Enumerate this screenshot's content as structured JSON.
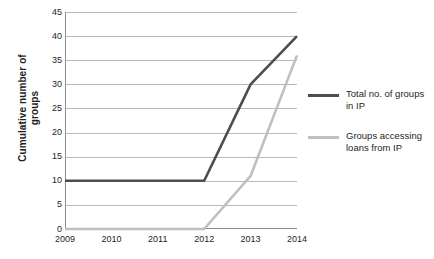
{
  "chart_data": {
    "type": "line",
    "title": "",
    "xlabel": "",
    "ylabel": "Cumulative number of groups",
    "ylabel_line1": "Cumulative number of",
    "ylabel_line2": "groups",
    "x": [
      "2009",
      "2010",
      "2011",
      "2012",
      "2013",
      "2014"
    ],
    "categories": [
      "2009",
      "2010",
      "2011",
      "2012",
      "2013",
      "2014"
    ],
    "xlim": [
      2009,
      2014
    ],
    "ylim": [
      0,
      45
    ],
    "ytick_step": 5,
    "yticks": [
      "45",
      "40",
      "35",
      "30",
      "25",
      "20",
      "15",
      "10",
      "5",
      "0"
    ],
    "ytick_values": [
      45,
      40,
      35,
      30,
      25,
      20,
      15,
      10,
      5,
      0
    ],
    "grid": "horizontal",
    "legend_position": "right",
    "series": [
      {
        "name": "Total no. of groups in IP",
        "name_line1": "Total no. of groups",
        "name_line2": "in IP",
        "color": "#4d4d4d",
        "values": [
          10,
          10,
          10,
          10,
          30,
          40
        ]
      },
      {
        "name": "Groups accessing loans from IP",
        "name_line1": "Groups accessing",
        "name_line2": "loans from IP",
        "color": "#bfbfbf",
        "values": [
          0,
          0,
          0,
          0,
          11,
          36
        ]
      }
    ]
  },
  "colors": {
    "gridline": "#b8b8b8",
    "axis": "#8c8c8c",
    "text": "#231f20",
    "background": "#ffffff",
    "series_dark": "#4d4d4d",
    "series_light": "#bfbfbf"
  }
}
